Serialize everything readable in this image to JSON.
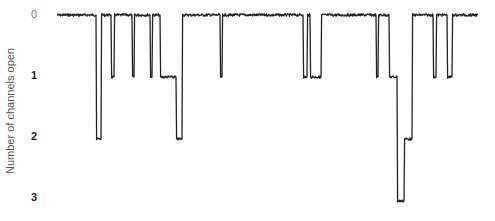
{
  "chart_data": {
    "type": "line",
    "title": "",
    "xlabel": "",
    "ylabel": "Number of channels open",
    "y_ticks": [
      "0",
      "1",
      "2",
      "3"
    ],
    "ylim": [
      0,
      3
    ],
    "y_inverted": true,
    "grid": false,
    "legend": null,
    "trace_color": "#222222",
    "x_pixels": [
      57,
      96,
      98,
      100,
      103,
      112,
      114,
      131,
      133,
      149,
      151,
      159,
      162,
      175,
      176,
      180,
      182,
      184,
      219,
      221,
      302,
      304,
      308,
      310,
      319,
      322,
      375,
      377,
      388,
      391,
      396,
      400,
      404,
      406,
      420,
      432,
      434,
      446,
      448,
      478
    ],
    "events": [
      {
        "x_start": 96,
        "x_end": 101,
        "level": 2
      },
      {
        "x_start": 111,
        "x_end": 114,
        "level": 1
      },
      {
        "x_start": 132,
        "x_end": 134,
        "level": 1
      },
      {
        "x_start": 150,
        "x_end": 152,
        "level": 1
      },
      {
        "x_start": 160,
        "x_end": 176,
        "level": 1
      },
      {
        "x_start": 176,
        "x_end": 182,
        "level": 2
      },
      {
        "x_start": 220,
        "x_end": 222,
        "level": 1
      },
      {
        "x_start": 303,
        "x_end": 307,
        "level": 1
      },
      {
        "x_start": 310,
        "x_end": 321,
        "level": 1
      },
      {
        "x_start": 376,
        "x_end": 378,
        "level": 1
      },
      {
        "x_start": 389,
        "x_end": 397,
        "level": 1
      },
      {
        "x_start": 397,
        "x_end": 404,
        "level": 3
      },
      {
        "x_start": 404,
        "x_end": 412,
        "level": 2
      },
      {
        "x_start": 433,
        "x_end": 436,
        "level": 1
      },
      {
        "x_start": 447,
        "x_end": 452,
        "level": 1
      }
    ]
  },
  "axis": {
    "label": "Number of channels open",
    "ticks": [
      "0",
      "1",
      "2",
      "3"
    ]
  }
}
